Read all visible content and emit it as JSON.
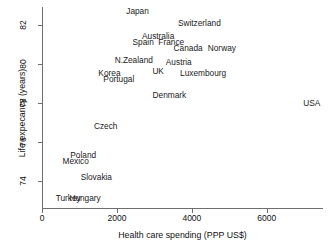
{
  "chart_data": {
    "type": "scatter",
    "title": "",
    "xlabel": "Health care spending (PPP US$)",
    "ylabel": "Life expecancy (years)",
    "xlim": [
      0,
      7500
    ],
    "ylim": [
      72.6,
      82.9
    ],
    "xticks": [
      0,
      2000,
      4000,
      6000
    ],
    "xtick_labels": [
      "0",
      "2000",
      "4000",
      "6000"
    ],
    "yticks": [
      74,
      76,
      78,
      80,
      82
    ],
    "ytick_labels": [
      "74",
      "76",
      "78",
      "80",
      "82"
    ],
    "grid": false,
    "legend": null,
    "labels_as_markers": true,
    "points": [
      {
        "name": "Japan",
        "x": 2550,
        "y": 82.7
      },
      {
        "name": "Switzerland",
        "x": 4200,
        "y": 82.1
      },
      {
        "name": "Australia",
        "x": 3100,
        "y": 81.4
      },
      {
        "name": "Spain",
        "x": 2700,
        "y": 81.1
      },
      {
        "name": "France",
        "x": 3450,
        "y": 81.1
      },
      {
        "name": "Canada",
        "x": 3900,
        "y": 80.8
      },
      {
        "name": "Norway",
        "x": 4800,
        "y": 80.8
      },
      {
        "name": "N.Zealand",
        "x": 2450,
        "y": 80.2
      },
      {
        "name": "Austria",
        "x": 3650,
        "y": 80.1
      },
      {
        "name": "Korea",
        "x": 1800,
        "y": 79.5
      },
      {
        "name": "UK",
        "x": 3100,
        "y": 79.6
      },
      {
        "name": "Luxembourg",
        "x": 4300,
        "y": 79.5
      },
      {
        "name": "Portugal",
        "x": 2050,
        "y": 79.2
      },
      {
        "name": "Denmark",
        "x": 3400,
        "y": 78.4
      },
      {
        "name": "USA",
        "x": 7200,
        "y": 78.0
      },
      {
        "name": "Czech",
        "x": 1700,
        "y": 76.8
      },
      {
        "name": "Poland",
        "x": 1100,
        "y": 75.3
      },
      {
        "name": "Mexico",
        "x": 900,
        "y": 75.0
      },
      {
        "name": "Slovakia",
        "x": 1450,
        "y": 74.2
      },
      {
        "name": "Turkey",
        "x": 700,
        "y": 73.1
      },
      {
        "name": "Hungary",
        "x": 1150,
        "y": 73.1
      }
    ]
  }
}
